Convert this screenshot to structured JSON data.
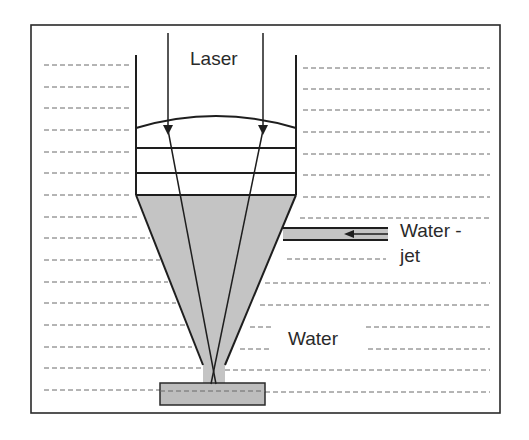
{
  "diagram": {
    "labels": {
      "laser": "Laser",
      "water_jet_line1": "Water -",
      "water_jet_line2": "jet",
      "water": "Water"
    },
    "colors": {
      "background": "#ffffff",
      "stroke": "#1e1e1e",
      "water_fill": "#c4c4c4",
      "dash": "#6a6a6a",
      "workpiece_fill": "#bdbdbd"
    },
    "components": [
      "frame",
      "laser-beam-left",
      "laser-beam-right",
      "nozzle-wall-left",
      "nozzle-wall-right",
      "focusing-lens",
      "window-layer-1",
      "window-layer-2",
      "water-chamber-cone",
      "water-jet-inlet-pipe",
      "water-jet-arrow",
      "water-jet-stream",
      "workpiece",
      "water-surface-dashes"
    ]
  }
}
